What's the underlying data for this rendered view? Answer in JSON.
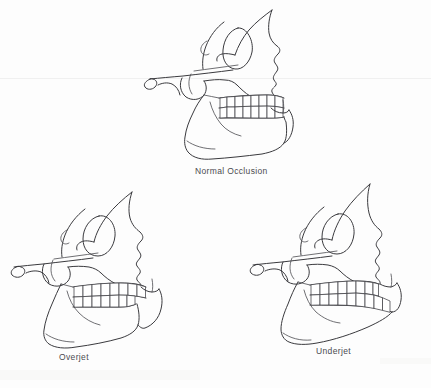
{
  "figure": {
    "background_color": "#fdfdfd",
    "ink_color": "#3a3a3e",
    "view": "lateral skull profile line drawing",
    "panel_count": 3
  },
  "panels": [
    {
      "id": "normal-occlusion",
      "caption": "Normal Occlusion",
      "position": "top-center",
      "description": "Lateral skull with upper and lower teeth meeting evenly",
      "upper_teeth_count": 8,
      "lower_teeth_count": 8,
      "bite_relation": "edge-aligned"
    },
    {
      "id": "overjet",
      "caption": "Overjet",
      "position": "bottom-left",
      "description": "Lateral skull with upper teeth projecting forward beyond lower teeth",
      "upper_teeth_count": 8,
      "lower_teeth_count": 8,
      "bite_relation": "maxilla protruded"
    },
    {
      "id": "underjet",
      "caption": "Underjet",
      "position": "bottom-right",
      "description": "Lateral skull with lower teeth projecting forward beyond upper teeth",
      "upper_teeth_count": 8,
      "lower_teeth_count": 8,
      "bite_relation": "mandible protruded"
    }
  ]
}
